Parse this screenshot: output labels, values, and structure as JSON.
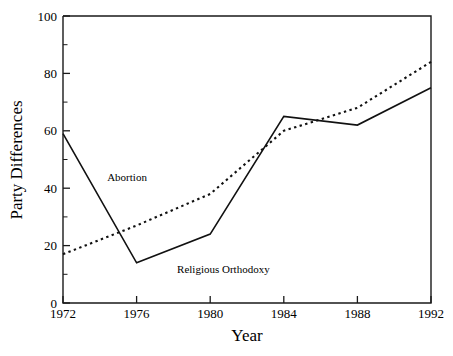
{
  "chart_data": {
    "type": "line",
    "title": "",
    "subtitle": "",
    "xlabel": "Year",
    "ylabel": "Party Differences",
    "x": [
      1972,
      1976,
      1980,
      1984,
      1988,
      1992
    ],
    "xtick_labels": [
      "1972",
      "1976",
      "1980",
      "1984",
      "1988",
      "1992"
    ],
    "ytick_labels": [
      "0",
      "20",
      "40",
      "60",
      "80",
      "100"
    ],
    "ytick_values": [
      0,
      20,
      40,
      60,
      80,
      100
    ],
    "xlim": [
      1972,
      1992
    ],
    "ylim": [
      0,
      100
    ],
    "y_minor_tick_step": 10,
    "x_minor_ticks": false,
    "grid": false,
    "legend": "inline-annotations",
    "series": [
      {
        "name": "Religious Orthodoxy",
        "style": "solid",
        "color": "#111111",
        "values": [
          59,
          14,
          24,
          65,
          62,
          75
        ]
      },
      {
        "name": "Abortion",
        "style": "dotted",
        "color": "#111111",
        "values": [
          17,
          27,
          38,
          60,
          68,
          84
        ]
      }
    ],
    "annotations": [
      {
        "text": "Abortion",
        "x": 1974.4,
        "y": 42.5
      },
      {
        "text": "Religious Orthodoxy",
        "x": 1978.2,
        "y": 10.5
      }
    ]
  },
  "axes": {
    "y_axis_title": "Party Differences",
    "x_axis_title": "Year"
  }
}
